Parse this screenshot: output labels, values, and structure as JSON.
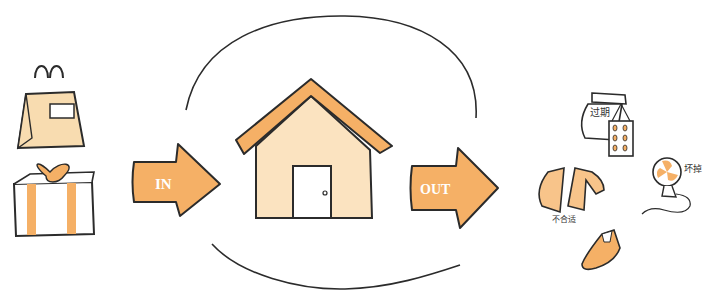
{
  "colors": {
    "outline": "#2b2b2b",
    "accent": "#f5b066",
    "house_wall": "#fbe3c0",
    "pale": "#f8dcb0",
    "white": "#ffffff"
  },
  "in_arrow": {
    "label": "IN"
  },
  "out_arrow": {
    "label": "OUT"
  },
  "incoming_items": [
    {
      "name": "shopping-bag"
    },
    {
      "name": "gift-box"
    }
  ],
  "outgoing_items": [
    {
      "name": "food-bag",
      "note": "过期"
    },
    {
      "name": "jacket",
      "note": "不合适"
    },
    {
      "name": "electric-fan",
      "note": "坏掉"
    },
    {
      "name": "shoe"
    }
  ]
}
